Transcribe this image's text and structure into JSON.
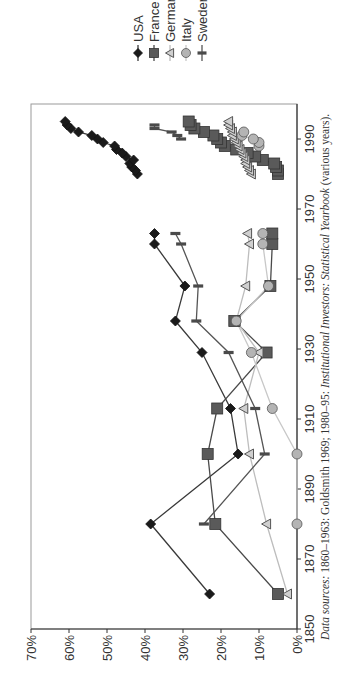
{
  "chart_data": {
    "type": "line",
    "title": "",
    "xlabel": "",
    "ylabel": "",
    "xlim": [
      1850,
      2000
    ],
    "ylim": [
      0,
      70
    ],
    "x_ticks": [
      "1850",
      "1870",
      "1890",
      "1910",
      "1930",
      "1950",
      "1970",
      "1990"
    ],
    "y_ticks": [
      "0%",
      "10%",
      "20%",
      "30%",
      "40%",
      "50%",
      "60%",
      "70%"
    ],
    "grid": false,
    "legend_position": "top-right (rotated)",
    "orientation": "rotated 90° counter-clockwise",
    "series": [
      {
        "name": "USA",
        "marker": "diamond",
        "color": "#1a1a1a",
        "line": "#3a3a3a",
        "segments": [
          [
            [
              1860,
              23
            ],
            [
              1880,
              38.5
            ],
            [
              1900,
              15.5
            ],
            [
              1913,
              17.5
            ],
            [
              1929,
              25
            ],
            [
              1938,
              32
            ],
            [
              1948,
              29.5
            ],
            [
              1960,
              37.5
            ],
            [
              1963,
              37.5
            ]
          ],
          [
            [
              1980,
              42
            ],
            [
              1981,
              42.5
            ],
            [
              1982,
              43.5
            ],
            [
              1983,
              44
            ],
            [
              1984,
              43
            ],
            [
              1985,
              45
            ],
            [
              1986,
              46
            ],
            [
              1987,
              47.5
            ],
            [
              1988,
              48
            ],
            [
              1989,
              51
            ],
            [
              1990,
              52.5
            ],
            [
              1991,
              54
            ],
            [
              1992,
              57.5
            ],
            [
              1993,
              59.5
            ],
            [
              1994,
              60.5
            ],
            [
              1995,
              61
            ]
          ]
        ]
      },
      {
        "name": "France",
        "marker": "square",
        "color": "#5a5a5a",
        "line": "#4a4a4a",
        "segments": [
          [
            [
              1860,
              5
            ],
            [
              1880,
              21.5
            ],
            [
              1900,
              23.5
            ],
            [
              1913,
              21
            ],
            [
              1929,
              8
            ],
            [
              1938,
              16.5
            ],
            [
              1948,
              7
            ],
            [
              1960,
              6.5
            ],
            [
              1963,
              6.5
            ]
          ],
          [
            [
              1980,
              5
            ],
            [
              1981,
              5
            ],
            [
              1982,
              5.5
            ],
            [
              1983,
              6
            ],
            [
              1984,
              9
            ],
            [
              1985,
              11
            ],
            [
              1986,
              13
            ],
            [
              1987,
              16
            ],
            [
              1988,
              19
            ],
            [
              1989,
              20
            ],
            [
              1990,
              21
            ],
            [
              1991,
              22
            ],
            [
              1992,
              24.5
            ],
            [
              1993,
              27
            ],
            [
              1994,
              28
            ],
            [
              1995,
              28.5
            ]
          ]
        ]
      },
      {
        "name": "Germany",
        "marker": "triangle",
        "color": "#cfcfcf",
        "line": "#bdbdbd",
        "segments": [
          [
            [
              1860,
              2.5
            ],
            [
              1880,
              8
            ],
            [
              1900,
              12.5
            ],
            [
              1913,
              14
            ],
            [
              1929,
              10
            ],
            [
              1938,
              16
            ],
            [
              1948,
              13.5
            ],
            [
              1960,
              12.5
            ],
            [
              1963,
              13
            ]
          ],
          [
            [
              1980,
              12
            ],
            [
              1981,
              12.5
            ],
            [
              1982,
              13
            ],
            [
              1983,
              13.5
            ],
            [
              1984,
              13.5
            ],
            [
              1985,
              14
            ],
            [
              1986,
              14.5
            ],
            [
              1987,
              15
            ],
            [
              1988,
              15.5
            ],
            [
              1989,
              16
            ],
            [
              1990,
              16.5
            ],
            [
              1991,
              17
            ],
            [
              1992,
              17
            ],
            [
              1993,
              17.5
            ],
            [
              1994,
              18
            ],
            [
              1995,
              18
            ]
          ]
        ]
      },
      {
        "name": "Italy",
        "marker": "circle",
        "color": "#b4b4b4",
        "line": "#c8c8c8",
        "segments": [
          [
            [
              1880,
              0
            ],
            [
              1900,
              0
            ],
            [
              1913,
              6.5
            ],
            [
              1929,
              12
            ],
            [
              1938,
              16
            ],
            [
              1948,
              7.5
            ],
            [
              1960,
              9
            ],
            [
              1963,
              9
            ]
          ],
          [
            [
              1988,
              10
            ],
            [
              1989,
              10
            ],
            [
              1990,
              11.5
            ],
            [
              1991,
              14.5
            ],
            [
              1992,
              14
            ]
          ]
        ]
      },
      {
        "name": "Sweden",
        "marker": "bar",
        "color": "#4a4a4a",
        "line": "#555555",
        "segments": [
          [
            [
              1880,
              24.5
            ],
            [
              1900,
              8.5
            ],
            [
              1913,
              11
            ],
            [
              1929,
              18
            ],
            [
              1938,
              26.5
            ],
            [
              1948,
              26
            ],
            [
              1960,
              30.5
            ],
            [
              1963,
              32
            ]
          ],
          [
            [
              1990,
              30.5
            ],
            [
              1991,
              31.5
            ],
            [
              1992,
              33
            ],
            [
              1993,
              37.5
            ],
            [
              1994,
              37.5
            ]
          ]
        ]
      }
    ]
  },
  "legend": {
    "items": [
      {
        "label": "USA"
      },
      {
        "label": "France"
      },
      {
        "label": "Germany"
      },
      {
        "label": "Italy"
      },
      {
        "label": "Sweden"
      }
    ]
  },
  "caption": {
    "prefix": "Data sources:",
    "text1": " 1860–1963: Goldsmith 1969; 1980–95: ",
    "italic2": "Institutional Investors: Statistical Yearbook",
    "text3": " (various years)."
  }
}
